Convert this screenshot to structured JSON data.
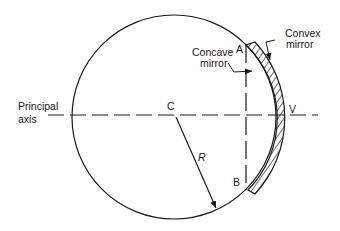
{
  "diagram": {
    "labels": {
      "point_a": "A",
      "point_b": "B",
      "center": "C",
      "vertex": "V",
      "radius": "R",
      "principal_axis_line1": "Principal",
      "principal_axis_line2": "axis",
      "concave_line1": "Concave",
      "concave_line2": "mirror",
      "convex_line1": "Convex",
      "convex_line2": "mirror"
    },
    "colors": {
      "stroke": "#1a1a1a",
      "background": "#ffffff"
    }
  }
}
